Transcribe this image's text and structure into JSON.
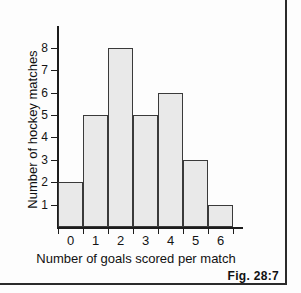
{
  "figure": {
    "caption": "Fig. 28:7"
  },
  "chart_data": {
    "type": "bar",
    "title": "",
    "xlabel": "Number of goals scored per match",
    "ylabel": "Number of hockey matches",
    "categories": [
      "0",
      "1",
      "2",
      "3",
      "4",
      "5",
      "6"
    ],
    "values": [
      2,
      5,
      8,
      5,
      6,
      3,
      1
    ],
    "ytick_labels": [
      "1",
      "2",
      "3",
      "4",
      "5",
      "6",
      "7",
      "8"
    ],
    "ytick_values": [
      1,
      2,
      3,
      4,
      5,
      6,
      7,
      8
    ],
    "ylim": [
      0,
      8.6
    ],
    "xlim": [
      0,
      7
    ],
    "grid": false,
    "legend": null,
    "bar_fill_color": "#e9e9e9",
    "bar_edge_color": "#3a3a3a",
    "axis_color": "#1c1c1c",
    "background_color": "#fdfdfd"
  }
}
